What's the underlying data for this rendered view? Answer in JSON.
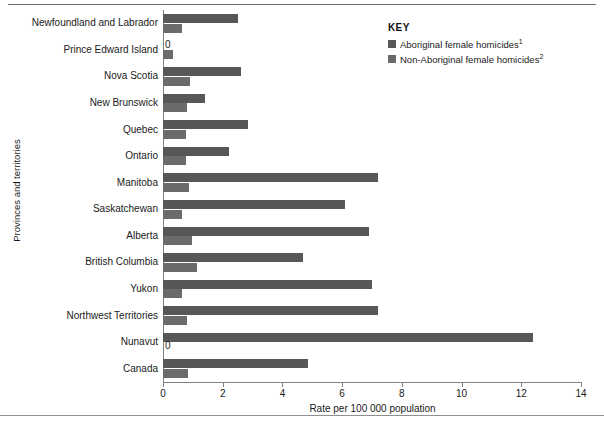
{
  "chart_data": {
    "type": "bar",
    "orientation": "horizontal",
    "title": "",
    "xlabel": "Rate per 100 000 population",
    "ylabel": "Provinces and territories",
    "xlim": [
      0,
      14
    ],
    "xticks": [
      0,
      2,
      4,
      6,
      8,
      10,
      12,
      14
    ],
    "xtick_labels": [
      "0",
      "2",
      "4",
      "6",
      "8",
      "10",
      "12",
      "14"
    ],
    "grid": false,
    "legend_position": "top-right",
    "categories": [
      "Newfoundland and Labrador",
      "Prince Edward Island",
      "Nova Scotia",
      "New Brunswick",
      "Quebec",
      "Ontario",
      "Manitoba",
      "Saskatchewan",
      "Alberta",
      "British Columbia",
      "Yukon",
      "Northwest Territories",
      "Nunavut",
      "Canada"
    ],
    "series": [
      {
        "name": "Aboriginal female homicides",
        "color": "#575757",
        "values": [
          2.5,
          0,
          2.6,
          1.4,
          2.85,
          2.2,
          7.2,
          6.1,
          6.9,
          4.7,
          7.0,
          7.2,
          12.4,
          4.85
        ]
      },
      {
        "name": "Non-Aboriginal female homicides",
        "color": "#6b6b6b",
        "values": [
          0.65,
          0.35,
          0.9,
          0.8,
          0.77,
          0.78,
          0.87,
          0.63,
          0.97,
          1.15,
          0.63,
          0.8,
          0,
          0.84
        ]
      }
    ],
    "annotations": [
      {
        "text": "0",
        "category": "Prince Edward Island",
        "series": "Aboriginal female homicides"
      },
      {
        "text": "0",
        "category": "Nunavut",
        "series": "Non-Aboriginal female homicides"
      }
    ]
  },
  "legend": {
    "title": "KEY",
    "items": [
      {
        "label": "Aboriginal female homicides",
        "footnote": "1",
        "color": "#575757"
      },
      {
        "label": "Non-Aboriginal female homicides",
        "footnote": "2",
        "color": "#6b6b6b"
      }
    ]
  },
  "axes": {
    "x_title": "Rate per 100 000 population",
    "y_title": "Provinces and territories"
  }
}
